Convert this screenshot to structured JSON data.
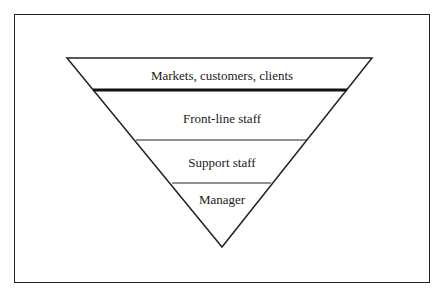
{
  "diagram": {
    "type": "inverted-pyramid",
    "layers": [
      {
        "label": "Markets, customers, clients",
        "emphasis_line_below": true
      },
      {
        "label": "Front-line staff"
      },
      {
        "label": "Support staff"
      },
      {
        "label": "Manager"
      }
    ],
    "colors": {
      "stroke": "#222222",
      "background": "#ffffff",
      "text": "#1a1a1a"
    }
  }
}
